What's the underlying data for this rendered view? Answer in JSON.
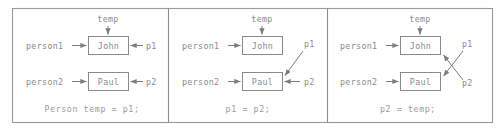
{
  "figure": {
    "colors": {
      "frame_border": "#9a9a9a",
      "divider": "#8d8d8d",
      "box_border": "#8a8a8a",
      "arrow": "#7c7c7c",
      "text": "#8a8a8a",
      "caption_text": "#9a9a9a",
      "background": "#ffffff"
    },
    "panels": [
      {
        "id": "panel-1",
        "caption": "Person temp = p1;",
        "top_label": "temp",
        "boxes": [
          {
            "id": "box-john",
            "label": "John"
          },
          {
            "id": "box-paul",
            "label": "Paul"
          }
        ],
        "left_labels": [
          {
            "id": "person1",
            "text": "person1",
            "target": "John"
          },
          {
            "id": "person2",
            "text": "person2",
            "target": "Paul"
          }
        ],
        "right_labels": [
          {
            "id": "p1",
            "text": "p1",
            "target": "John",
            "style": "horizontal"
          },
          {
            "id": "p2",
            "text": "p2",
            "target": "Paul",
            "style": "horizontal"
          }
        ]
      },
      {
        "id": "panel-2",
        "caption": "p1 = p2;",
        "top_label": "temp",
        "boxes": [
          {
            "id": "box-john",
            "label": "John"
          },
          {
            "id": "box-paul",
            "label": "Paul"
          }
        ],
        "left_labels": [
          {
            "id": "person1",
            "text": "person1",
            "target": "John"
          },
          {
            "id": "person2",
            "text": "person2",
            "target": "Paul"
          }
        ],
        "right_labels": [
          {
            "id": "p1",
            "text": "p1",
            "target": "Paul",
            "style": "diagonal-down"
          },
          {
            "id": "p2",
            "text": "p2",
            "target": "Paul",
            "style": "horizontal"
          }
        ]
      },
      {
        "id": "panel-3",
        "caption": "p2 = temp;",
        "top_label": "temp",
        "boxes": [
          {
            "id": "box-john",
            "label": "John"
          },
          {
            "id": "box-paul",
            "label": "Paul"
          }
        ],
        "left_labels": [
          {
            "id": "person1",
            "text": "person1",
            "target": "John"
          },
          {
            "id": "person2",
            "text": "person2",
            "target": "Paul"
          }
        ],
        "right_labels": [
          {
            "id": "p1",
            "text": "p1",
            "target": "Paul",
            "style": "diagonal-down"
          },
          {
            "id": "p2",
            "text": "p2",
            "target": "John",
            "style": "diagonal-up"
          }
        ]
      }
    ]
  }
}
